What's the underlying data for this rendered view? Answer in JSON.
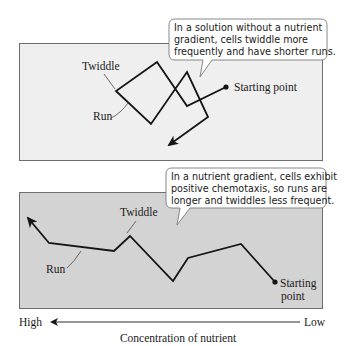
{
  "top_panel": {
    "callout": {
      "lines": [
        "In a solution without a nutrient",
        "gradient, cells twiddle more",
        "frequently and have shorter runs."
      ]
    },
    "labels": {
      "twiddle": "Twiddle",
      "run": "Run",
      "start": "Starting point"
    },
    "fill_color": "#efefef"
  },
  "bottom_panel": {
    "callout": {
      "lines": [
        "In a nutrient gradient, cells exhibit",
        "positive chemotaxis, so runs are",
        "longer and twiddles less frequent."
      ]
    },
    "labels": {
      "twiddle": "Twiddle",
      "run": "Run",
      "start_line1": "Starting",
      "start_line2": "point"
    },
    "fill_color": "#d3d3d3"
  },
  "axis": {
    "left_label": "High",
    "right_label": "Low",
    "title": "Concentration of nutrient"
  }
}
